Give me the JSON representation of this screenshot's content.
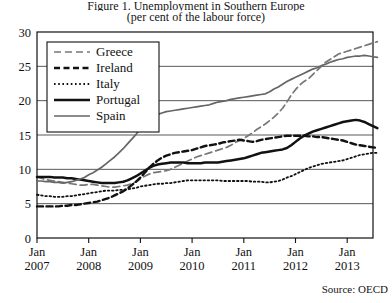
{
  "chart_data": {
    "type": "line",
    "title": "Figure 1. Unemployment in Southern Europe",
    "subtitle": "(per cent of the labour force)",
    "source": "Source: OECD",
    "xlabel": "",
    "ylabel": "",
    "ylim": [
      0,
      30
    ],
    "yticks": [
      0,
      5,
      10,
      15,
      20,
      25,
      30
    ],
    "xticks": [
      "Jan\n2007",
      "Jan\n2008",
      "Jan\n2009",
      "Jan\n2010",
      "Jan\n2011",
      "Jan\n2012",
      "Jan\n2013"
    ],
    "xtick_lines": [
      "Jan",
      "2007",
      "Jan",
      "2008",
      "Jan",
      "2009",
      "Jan",
      "2010",
      "Jan",
      "2011",
      "Jan",
      "2012",
      "Jan",
      "2013"
    ],
    "grid": "horizontal",
    "legend_position": "upper-left",
    "series": [
      {
        "name": "Greece",
        "style": "dashed",
        "color": "#777777",
        "values": [
          8.9,
          8.7,
          8.5,
          8.4,
          8.3,
          8.2,
          8.1,
          8.0,
          7.9,
          7.8,
          7.7,
          7.7,
          7.8,
          7.8,
          7.7,
          7.6,
          7.5,
          7.4,
          7.4,
          7.5,
          7.6,
          7.7,
          7.9,
          8.2,
          8.6,
          9.0,
          9.3,
          9.5,
          9.6,
          9.7,
          9.8,
          10.0,
          10.3,
          10.6,
          10.9,
          11.2,
          11.5,
          11.8,
          12.0,
          12.2,
          12.4,
          12.6,
          12.8,
          13.0,
          13.2,
          13.5,
          13.9,
          14.2,
          14.5,
          14.9,
          15.3,
          15.8,
          16.2,
          16.6,
          17.1,
          17.6,
          18.2,
          18.9,
          19.8,
          20.8,
          21.6,
          22.3,
          22.8,
          23.2,
          23.8,
          24.4,
          25.0,
          25.6,
          26.0,
          26.4,
          26.8,
          27.0,
          27.2,
          27.4,
          27.6,
          27.8,
          28.0,
          28.2,
          28.4,
          28.6
        ]
      },
      {
        "name": "Ireland",
        "style": "dashed-bold",
        "color": "#111111",
        "values": [
          4.6,
          4.6,
          4.6,
          4.6,
          4.6,
          4.6,
          4.7,
          4.7,
          4.8,
          4.8,
          4.9,
          5.0,
          5.1,
          5.2,
          5.3,
          5.5,
          5.7,
          5.9,
          6.2,
          6.5,
          6.8,
          7.2,
          7.7,
          8.2,
          8.8,
          9.5,
          10.2,
          10.8,
          11.3,
          11.7,
          12.0,
          12.2,
          12.4,
          12.5,
          12.6,
          12.7,
          12.8,
          13.0,
          13.2,
          13.4,
          13.5,
          13.6,
          13.7,
          13.9,
          14.0,
          14.1,
          14.2,
          14.3,
          14.2,
          14.1,
          14.0,
          14.1,
          14.3,
          14.4,
          14.5,
          14.6,
          14.7,
          14.8,
          14.9,
          14.9,
          14.9,
          14.9,
          14.9,
          14.8,
          14.8,
          14.7,
          14.7,
          14.6,
          14.5,
          14.4,
          14.3,
          14.2,
          14.0,
          13.8,
          13.6,
          13.5,
          13.4,
          13.3,
          13.2,
          13.1
        ]
      },
      {
        "name": "Italy",
        "style": "dotted",
        "color": "#111111",
        "values": [
          6.3,
          6.2,
          6.1,
          6.1,
          6.0,
          6.0,
          6.0,
          6.1,
          6.1,
          6.2,
          6.3,
          6.4,
          6.5,
          6.6,
          6.7,
          6.8,
          6.9,
          6.9,
          6.9,
          7.0,
          7.0,
          7.1,
          7.2,
          7.3,
          7.5,
          7.6,
          7.7,
          7.8,
          7.9,
          7.9,
          8.0,
          8.0,
          8.1,
          8.2,
          8.3,
          8.4,
          8.4,
          8.4,
          8.4,
          8.4,
          8.4,
          8.4,
          8.4,
          8.3,
          8.3,
          8.3,
          8.3,
          8.3,
          8.3,
          8.3,
          8.2,
          8.2,
          8.2,
          8.1,
          8.1,
          8.2,
          8.3,
          8.5,
          8.8,
          9.0,
          9.3,
          9.6,
          9.9,
          10.2,
          10.4,
          10.6,
          10.8,
          10.9,
          11.0,
          11.1,
          11.2,
          11.3,
          11.5,
          11.7,
          11.9,
          12.1,
          12.2,
          12.3,
          12.4,
          12.4
        ]
      },
      {
        "name": "Portugal",
        "style": "solid-bold",
        "color": "#111111",
        "values": [
          8.9,
          8.9,
          8.9,
          8.9,
          8.8,
          8.8,
          8.8,
          8.7,
          8.7,
          8.6,
          8.5,
          8.4,
          8.3,
          8.2,
          8.1,
          8.0,
          8.0,
          8.0,
          8.0,
          8.1,
          8.2,
          8.4,
          8.7,
          9.0,
          9.4,
          9.8,
          10.2,
          10.5,
          10.7,
          10.8,
          10.9,
          11.0,
          11.0,
          11.0,
          11.0,
          10.9,
          10.9,
          10.9,
          10.9,
          11.0,
          11.0,
          11.0,
          11.0,
          11.1,
          11.2,
          11.3,
          11.4,
          11.5,
          11.6,
          11.8,
          12.0,
          12.2,
          12.4,
          12.5,
          12.6,
          12.7,
          12.8,
          12.9,
          13.1,
          13.5,
          14.0,
          14.5,
          14.9,
          15.2,
          15.5,
          15.7,
          15.9,
          16.1,
          16.3,
          16.5,
          16.7,
          16.9,
          17.0,
          17.1,
          17.2,
          17.1,
          16.9,
          16.6,
          16.3,
          16.0
        ]
      },
      {
        "name": "Spain",
        "style": "solid",
        "color": "#666666",
        "values": [
          8.3,
          8.3,
          8.2,
          8.2,
          8.1,
          8.1,
          8.0,
          8.1,
          8.2,
          8.4,
          8.6,
          8.8,
          9.2,
          9.5,
          9.9,
          10.3,
          10.8,
          11.3,
          11.8,
          12.4,
          13.0,
          13.7,
          14.4,
          15.1,
          15.9,
          16.6,
          17.2,
          17.7,
          18.0,
          18.2,
          18.4,
          18.5,
          18.6,
          18.7,
          18.8,
          18.9,
          19.0,
          19.1,
          19.2,
          19.3,
          19.4,
          19.6,
          19.8,
          19.9,
          20.0,
          20.2,
          20.3,
          20.4,
          20.5,
          20.6,
          20.7,
          20.8,
          20.9,
          21.0,
          21.3,
          21.7,
          22.0,
          22.4,
          22.8,
          23.1,
          23.4,
          23.7,
          24.0,
          24.3,
          24.6,
          24.8,
          25.1,
          25.3,
          25.6,
          25.8,
          26.0,
          26.1,
          26.3,
          26.4,
          26.5,
          26.5,
          26.6,
          26.5,
          26.4,
          26.3
        ]
      }
    ],
    "legend": [
      {
        "label": "Greece",
        "style": "dashed",
        "color": "#777777"
      },
      {
        "label": "Ireland",
        "style": "dashed-bold",
        "color": "#111111"
      },
      {
        "label": "Italy",
        "style": "dotted",
        "color": "#111111"
      },
      {
        "label": "Portugal",
        "style": "solid-bold",
        "color": "#111111"
      },
      {
        "label": "Spain",
        "style": "solid",
        "color": "#666666"
      }
    ]
  }
}
